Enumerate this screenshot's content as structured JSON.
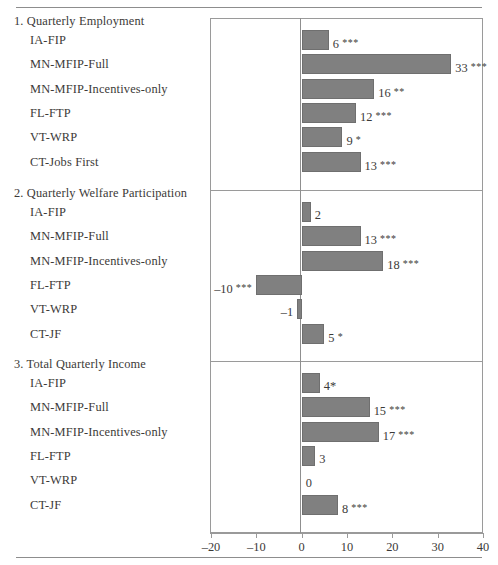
{
  "chart_data": {
    "type": "bar",
    "title": "",
    "orientation": "horizontal",
    "xlabel": "",
    "ylabel": "",
    "xlim": [
      -20,
      40
    ],
    "xticks": [
      -20,
      -10,
      0,
      10,
      20,
      30,
      40
    ],
    "xtick_labels": [
      "–20",
      "–10",
      "0",
      "10",
      "20",
      "30",
      "40"
    ],
    "grid": false,
    "legend": "none",
    "bar_color": "#808080",
    "zero_line": 0,
    "panels": [
      {
        "title": "1. Quarterly Employment",
        "categories": [
          "IA-FIP",
          "MN-MFIP-Full",
          "MN-MFIP-Incentives-only",
          "FL-FTP",
          "VT-WRP",
          "CT-Jobs First"
        ],
        "values": [
          6,
          33,
          16,
          12,
          9,
          13
        ],
        "significance": [
          "***",
          "***",
          "**",
          "***",
          "*",
          "***"
        ],
        "labels": [
          "6 ***",
          "33 ***",
          "16 **",
          "12 ***",
          "9 *",
          "13 ***"
        ]
      },
      {
        "title": "2. Quarterly Welfare Participation",
        "categories": [
          "IA-FIP",
          "MN-MFIP-Full",
          "MN-MFIP-Incentives-only",
          "FL-FTP",
          "VT-WRP",
          "CT-JF"
        ],
        "values": [
          2,
          13,
          18,
          -10,
          -1,
          5
        ],
        "significance": [
          "",
          "***",
          "***",
          "***",
          "",
          "*"
        ],
        "labels": [
          "2",
          "13 ***",
          "18 ***",
          "–10 ***",
          "–1",
          "5 *"
        ]
      },
      {
        "title": "3. Total Quarterly Income",
        "categories": [
          "IA-FIP",
          "MN-MFIP-Full",
          "MN-MFIP-Incentives-only",
          "FL-FTP",
          "VT-WRP",
          "CT-JF"
        ],
        "values": [
          4,
          15,
          17,
          3,
          0,
          8
        ],
        "significance": [
          "*",
          "***",
          "***",
          "",
          "",
          "***"
        ],
        "labels": [
          "4*",
          "15 ***",
          "17 ***",
          "3",
          "0",
          "8 ***"
        ]
      }
    ]
  }
}
